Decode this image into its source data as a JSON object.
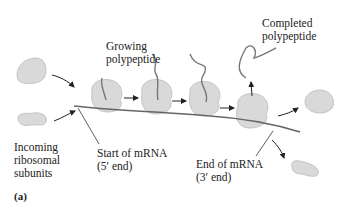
{
  "diagram": {
    "panel_label": "(a)",
    "labels": {
      "growing_polypeptide": [
        "Growing",
        "polypeptide"
      ],
      "completed_polypeptide": [
        "Completed",
        "polypeptide"
      ],
      "incoming_subunits": [
        "Incoming",
        "ribosomal",
        "subunits"
      ],
      "start_mrna": [
        "Start of mRNA",
        "(5′ end)"
      ],
      "end_mrna": [
        "End of mRNA",
        "(3′ end)"
      ]
    },
    "colors": {
      "ribosome_fill": "#d9d9d9",
      "ribosome_stroke": "#bdbdbd",
      "strand": "#666666",
      "arrow": "#222222",
      "text": "#222222"
    }
  }
}
